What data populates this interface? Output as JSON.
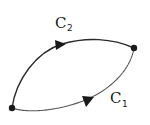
{
  "diagram": {
    "type": "directed-curves",
    "nodes": [
      {
        "id": "start",
        "position": "bottom-left"
      },
      {
        "id": "end",
        "position": "top-right"
      }
    ],
    "paths": [
      {
        "id": "C2",
        "label_main": "C",
        "label_sub": "2",
        "route": "upper",
        "from": "start",
        "to": "end",
        "arrow_direction": "right"
      },
      {
        "id": "C1",
        "label_main": "C",
        "label_sub": "1",
        "route": "lower",
        "from": "start",
        "to": "end",
        "arrow_direction": "right"
      }
    ]
  },
  "colors": {
    "stroke": "#2a2a2a",
    "background": "#ffffff"
  }
}
